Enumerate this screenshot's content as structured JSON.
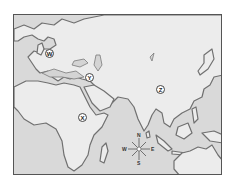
{
  "map": {
    "region": "Eastern Hemisphere (Europe, Africa, Asia, Australia)",
    "colors": {
      "water": "#d9d9d9",
      "land": "#e8e8e8",
      "coast": "#6f6f6f",
      "frame": "#555555"
    },
    "markers": [
      {
        "label": "W",
        "x": 49,
        "y": 53,
        "place": "Central Europe"
      },
      {
        "label": "Y",
        "x": 89,
        "y": 77,
        "place": "Arabian Peninsula"
      },
      {
        "label": "Z",
        "x": 160,
        "y": 89,
        "place": "Southern China"
      },
      {
        "label": "X",
        "x": 82,
        "y": 117,
        "place": "East Africa"
      }
    ],
    "compass": {
      "n": "N",
      "s": "S",
      "e": "E",
      "w": "W",
      "x": 138,
      "y": 148
    }
  }
}
